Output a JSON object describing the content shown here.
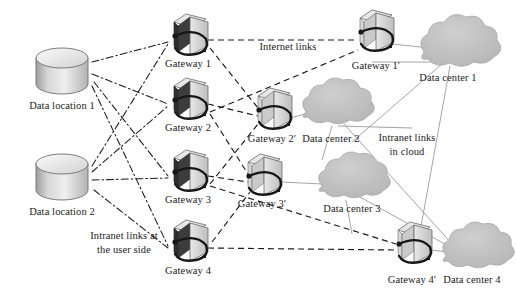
{
  "diagram": {
    "palette": {
      "background": "#ffffff",
      "text": "#1a1a1a",
      "cloud_fill": "#bdbdbd",
      "cloud_stroke": "#a8a8a8",
      "server_light": "#e2e2e2",
      "server_mid": "#c9c9c9",
      "server_dark": "#3a3a3a",
      "cylinder_light": "#efefef",
      "cylinder_mid": "#c0c0c0",
      "intranet_user_link": "#1a1a1a",
      "internet_link": "#1a1a1a",
      "cloud_link": "#9a9a9a"
    },
    "link_styles": {
      "intranet_user_side": "dash-dot",
      "internet": "dashed",
      "intranet_in_cloud": "solid-thin-gray"
    },
    "data_locations": [
      {
        "id": "dl1",
        "label": "Data location 1",
        "x": 62,
        "y": 72,
        "label_x": 62,
        "label_y": 106
      },
      {
        "id": "dl2",
        "label": "Data location 2",
        "x": 62,
        "y": 178,
        "label_x": 62,
        "label_y": 212
      }
    ],
    "user_gateways": [
      {
        "id": "gw1",
        "label": "Gateway 1",
        "x": 188,
        "y": 38,
        "label_x": 188,
        "label_y": 63
      },
      {
        "id": "gw2",
        "label": "Gateway 2",
        "x": 188,
        "y": 102,
        "label_x": 188,
        "label_y": 127
      },
      {
        "id": "gw3",
        "label": "Gateway 3",
        "x": 188,
        "y": 174,
        "label_x": 188,
        "label_y": 199
      },
      {
        "id": "gw4",
        "label": "Gateway 4",
        "x": 188,
        "y": 244,
        "label_x": 188,
        "label_y": 270
      }
    ],
    "dc_gateways": [
      {
        "id": "gw1p",
        "label": "Gateway 1′",
        "x": 374,
        "y": 34,
        "label_x": 374,
        "label_y": 66
      },
      {
        "id": "gw2p",
        "label": "Gateway 2′",
        "x": 272,
        "y": 112,
        "label_x": 272,
        "label_y": 139
      },
      {
        "id": "gw3p",
        "label": "Gateway 3′",
        "x": 262,
        "y": 178,
        "label_x": 262,
        "label_y": 204
      },
      {
        "id": "gw4p",
        "label": "Gateway 4′",
        "x": 412,
        "y": 246,
        "label_x": 412,
        "label_y": 280
      }
    ],
    "data_centers": [
      {
        "id": "dc1",
        "label": "Data center 1",
        "x": 448,
        "y": 48,
        "label_x": 448,
        "label_y": 78
      },
      {
        "id": "dc2",
        "label": "Data center 2",
        "x": 330,
        "y": 108,
        "label_x": 331,
        "label_y": 139
      },
      {
        "id": "dc3",
        "label": "Data center 3",
        "x": 347,
        "y": 182,
        "label_x": 352,
        "label_y": 209
      },
      {
        "id": "dc4",
        "label": "Data center 4",
        "x": 470,
        "y": 252,
        "label_x": 472,
        "label_y": 280
      }
    ],
    "annotations": [
      {
        "id": "internet",
        "label": "Internet links",
        "x": 288,
        "y": 46
      },
      {
        "id": "cloud_links",
        "label": "Intranet links\nin cloud",
        "line1": "Intranet links",
        "line2": "in cloud",
        "x": 407,
        "y": 145
      },
      {
        "id": "user_links",
        "label": "Intranet links at\nthe user side",
        "line1": "Intranet links at",
        "line2": "the user side",
        "x": 124,
        "y": 236
      }
    ]
  }
}
